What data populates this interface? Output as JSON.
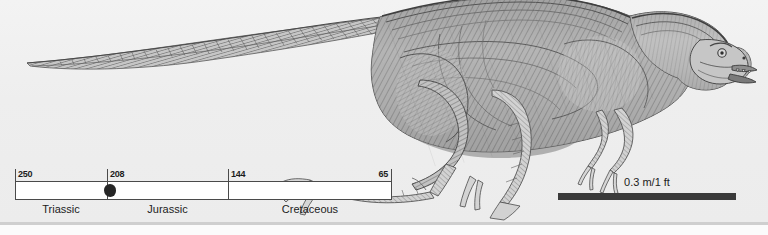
{
  "figure": {
    "background_color": "#eeeeee",
    "ink_color": "#4a4a4a"
  },
  "timeline": {
    "name": "geologic-time-scale",
    "axis_label_unit": "million years ago",
    "ticks": [
      {
        "value": "250",
        "align": "left",
        "x": 0
      },
      {
        "value": "208",
        "align": "left",
        "x": 92
      },
      {
        "value": "144",
        "align": "left",
        "x": 213
      },
      {
        "value": "65",
        "align": "right",
        "x": 377
      }
    ],
    "periods": [
      {
        "label": "Triassic",
        "center": 46
      },
      {
        "label": "Jurassic",
        "center": 153
      },
      {
        "label": "Cretaceous",
        "center": 295
      }
    ],
    "marker": {
      "name": "occurrence-marker",
      "shape": "filled-oval",
      "color": "#262626",
      "x": 89
    },
    "range_start": "250",
    "range_end": "65"
  },
  "scale": {
    "label": "0.3 m/1 ft",
    "bar_color": "#3a3a3a"
  }
}
